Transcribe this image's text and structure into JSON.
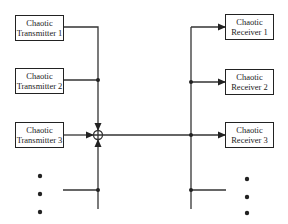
{
  "diagram": {
    "transmitters": [
      {
        "line1": "Chaotic",
        "line2": "Transmitter 1"
      },
      {
        "line1": "Chaotic",
        "line2": "Transmitter 2"
      },
      {
        "line1": "Chaotic",
        "line2": "Transmitter 3"
      }
    ],
    "receivers": [
      {
        "line1": "Chaotic",
        "line2": "Receiver 1"
      },
      {
        "line1": "Chaotic",
        "line2": "Receiver 2"
      },
      {
        "line1": "Chaotic",
        "line2": "Receiver 3"
      }
    ],
    "summing_junction_symbol": "+",
    "ellipsis": "vertical-dots",
    "colors": {
      "line": "#333333",
      "background": "#ffffff"
    }
  }
}
